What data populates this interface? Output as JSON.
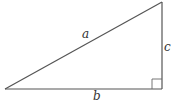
{
  "diagram": {
    "type": "right-triangle",
    "stroke_color": "#555555",
    "vertices": {
      "left": [
        5,
        89
      ],
      "right_angle": [
        162,
        89
      ],
      "top": [
        162,
        2
      ]
    },
    "right_angle_marker_size": 10,
    "labels": {
      "hypotenuse": "a",
      "base": "b",
      "height": "c"
    }
  }
}
